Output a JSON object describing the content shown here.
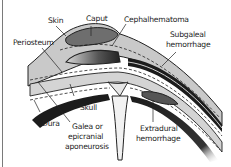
{
  "diagram": {
    "type": "anatomical-cross-section",
    "colors": {
      "background": "#ffffff",
      "skin_layer": "#c9c9c9",
      "dark_band": "#1c1c1c",
      "collection_fill": "#6e6e6e",
      "skull_fill": "#d4d4d4",
      "label_text": "#222222",
      "border": "#7a7a7a"
    },
    "labels": {
      "skin": "Skin",
      "caput": "Caput",
      "cephalhematoma": "Cephalhematoma",
      "periosteum": "Periosteum",
      "subgaleal_line1": "Subgaleal",
      "subgaleal_line2": "hemorrhage",
      "skull": "Skull",
      "dura": "Dura",
      "galea_line1": "Galea or",
      "galea_line2": "epicranial",
      "galea_line3": "aponeurosis",
      "extradural_line1": "Extradural",
      "extradural_line2": "hemorrhage"
    }
  }
}
